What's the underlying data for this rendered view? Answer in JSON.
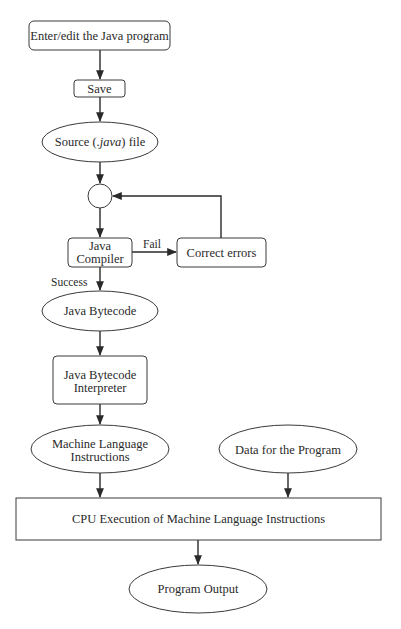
{
  "diagram": {
    "type": "flowchart",
    "nodes": [
      {
        "id": "enter",
        "shape": "rounded-rect",
        "label": "Enter/edit the Java program"
      },
      {
        "id": "save",
        "shape": "rounded-rect",
        "label": "Save"
      },
      {
        "id": "source",
        "shape": "ellipse",
        "label_pre": "Source (",
        "label_italic": ".java",
        "label_post": ") file"
      },
      {
        "id": "junction",
        "shape": "circle",
        "label": ""
      },
      {
        "id": "compiler",
        "shape": "rounded-rect",
        "label_line1": "Java",
        "label_line2": "Compiler"
      },
      {
        "id": "correct",
        "shape": "rounded-rect",
        "label": "Correct errors"
      },
      {
        "id": "bytecode",
        "shape": "ellipse",
        "label": "Java Bytecode"
      },
      {
        "id": "interpreter",
        "shape": "rounded-rect",
        "label_line1": "Java Bytecode",
        "label_line2": "Interpreter"
      },
      {
        "id": "machine",
        "shape": "ellipse",
        "label_line1": "Machine Language",
        "label_line2": "Instructions"
      },
      {
        "id": "data",
        "shape": "ellipse",
        "label": "Data for the Program"
      },
      {
        "id": "cpu",
        "shape": "rect",
        "label": "CPU Execution of Machine Language Instructions"
      },
      {
        "id": "output",
        "shape": "ellipse",
        "label": "Program Output"
      }
    ],
    "edges": [
      {
        "from": "enter",
        "to": "save",
        "label": ""
      },
      {
        "from": "save",
        "to": "source",
        "label": ""
      },
      {
        "from": "source",
        "to": "junction",
        "label": ""
      },
      {
        "from": "junction",
        "to": "compiler",
        "label": ""
      },
      {
        "from": "compiler",
        "to": "correct",
        "label": "Fail"
      },
      {
        "from": "correct",
        "to": "junction",
        "label": ""
      },
      {
        "from": "compiler",
        "to": "bytecode",
        "label": "Success"
      },
      {
        "from": "bytecode",
        "to": "interpreter",
        "label": ""
      },
      {
        "from": "interpreter",
        "to": "machine",
        "label": ""
      },
      {
        "from": "machine",
        "to": "cpu",
        "label": ""
      },
      {
        "from": "data",
        "to": "cpu",
        "label": ""
      },
      {
        "from": "cpu",
        "to": "output",
        "label": ""
      }
    ],
    "edge_labels": {
      "fail": "Fail",
      "success": "Success"
    }
  }
}
